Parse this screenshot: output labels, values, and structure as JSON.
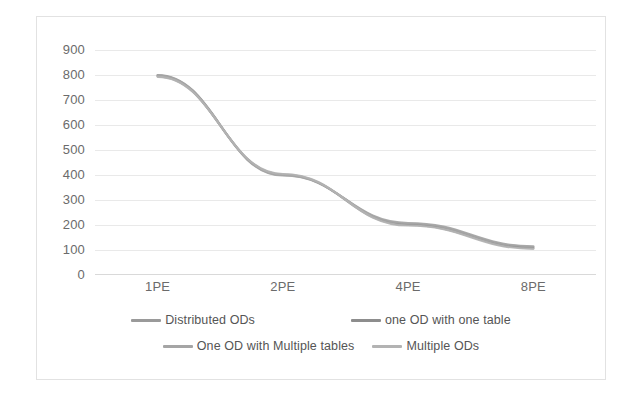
{
  "chart_data": {
    "type": "line",
    "title": "",
    "xlabel": "",
    "ylabel": "",
    "categories": [
      "1PE",
      "2PE",
      "4PE",
      "8PE"
    ],
    "series": [
      {
        "name": "Distributed ODs",
        "values": [
          800,
          400,
          205,
          112
        ],
        "color": "#9a9a9a"
      },
      {
        "name": "one OD with one table",
        "values": [
          795,
          402,
          200,
          108
        ],
        "color": "#8d8d8d"
      },
      {
        "name": "One OD with Multiple tables",
        "values": [
          798,
          398,
          208,
          115
        ],
        "color": "#a5a5a5"
      },
      {
        "name": "Multiple ODs",
        "values": [
          793,
          404,
          198,
          105
        ],
        "color": "#b3b3b3"
      }
    ],
    "ylim": [
      0,
      900
    ],
    "yticks": [
      900,
      800,
      700,
      600,
      500,
      400,
      300,
      200,
      100,
      0
    ],
    "ytick_labels": [
      "900",
      "800",
      "700",
      "600",
      "500",
      "400",
      "300",
      "200",
      "100",
      "0"
    ],
    "grid": true,
    "legend_position": "bottom",
    "legend_rows": [
      [
        "Distributed ODs",
        "one OD with one table"
      ],
      [
        "One OD with Multiple tables",
        "Multiple ODs"
      ]
    ]
  },
  "colors": {
    "frame_border": "#e2e2e2",
    "gridline": "#e9e9e9",
    "axis": "#d9d9d9",
    "tick_text": "#6b6b6b",
    "legend_text": "#555555",
    "background": "#ffffff"
  }
}
